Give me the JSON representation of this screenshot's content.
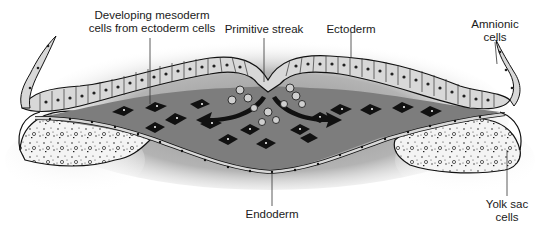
{
  "diagram": {
    "type": "biology-illustration",
    "labels": {
      "developing_mesoderm_line1": "Developing mesoderm",
      "developing_mesoderm_line2": "cells from ectoderm cells",
      "primitive_streak": "Primitive streak",
      "ectoderm": "Ectoderm",
      "amnionic_line1": "Amnionic",
      "amnionic_line2": "cells",
      "endoderm": "Endoderm",
      "yolk_sac_line1": "Yolk sac",
      "yolk_sac_line2": "cells"
    },
    "colors": {
      "background": "#ffffff",
      "halo": "#8a8a8a",
      "cavity_fill": "#7d7d7d",
      "cell_fill": "#d8d8d8",
      "outline": "#1a1a1a",
      "mesoderm_cells": "#111111",
      "yolk_speckle": "#2a2a2a",
      "leader_line": "#333333"
    }
  }
}
